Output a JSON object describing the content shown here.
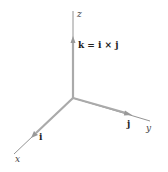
{
  "diagram": {
    "type": "3d-coordinate-axes",
    "colors": {
      "axis": "#666666",
      "vector": "#aaaaaa",
      "label": "#333333"
    },
    "axes": {
      "x": {
        "label": "x"
      },
      "y": {
        "label": "y"
      },
      "z": {
        "label": "z"
      }
    },
    "vectors": {
      "i": {
        "label": "i"
      },
      "j": {
        "label": "j"
      },
      "k": {
        "label": "k = i × j"
      }
    }
  }
}
